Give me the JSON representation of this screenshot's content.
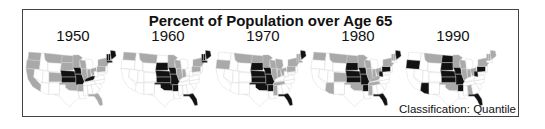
{
  "chart_data": {
    "type": "heatmap",
    "title": "Percent of Population over Age 65",
    "note": "Classification:  Quantile",
    "legend_classes": {
      "low": "#ffffff",
      "mid": "#a9a9a9",
      "high": "#111111"
    },
    "years": [
      "1950",
      "1960",
      "1970",
      "1980",
      "1990"
    ],
    "maps": [
      {
        "year": "1950",
        "high": [
          "NE",
          "KS",
          "IA",
          "MO",
          "KY",
          "ME",
          "NH",
          "VT",
          "MA"
        ],
        "mid": [
          "WA",
          "OR",
          "CA",
          "MT",
          "ND",
          "SD",
          "MN",
          "WI",
          "CO",
          "OK",
          "AR",
          "IL",
          "IN",
          "OH",
          "PA",
          "NY",
          "FL"
        ]
      },
      {
        "year": "1960",
        "high": [
          "SD",
          "NE",
          "KS",
          "IA",
          "MO",
          "OK",
          "AR",
          "FL",
          "ME",
          "NH",
          "VT",
          "MA"
        ],
        "mid": [
          "WA",
          "MT",
          "MN",
          "WI",
          "IL",
          "IN",
          "NY",
          "PA"
        ]
      },
      {
        "year": "1970",
        "high": [
          "SD",
          "NE",
          "KS",
          "IA",
          "MO",
          "OK",
          "AR",
          "FL",
          "ME"
        ],
        "mid": [
          "MT",
          "ND",
          "MN",
          "WI",
          "MI",
          "IL",
          "IN",
          "OH",
          "PA",
          "NY",
          "NH",
          "VT",
          "MA",
          "TN",
          "MS",
          "OR"
        ]
      },
      {
        "year": "1980",
        "high": [
          "SD",
          "NE",
          "KS",
          "IA",
          "MO",
          "AR",
          "FL",
          "WV",
          "PA",
          "ME"
        ],
        "mid": [
          "WA",
          "MT",
          "ND",
          "MN",
          "WI",
          "AZ",
          "CO",
          "OK",
          "IL",
          "IN",
          "OH",
          "KY",
          "TN",
          "MS",
          "NY",
          "NH",
          "VT"
        ]
      },
      {
        "year": "1990",
        "high": [
          "OR",
          "AZ",
          "ND",
          "SD",
          "NE",
          "KS",
          "IA",
          "MO",
          "AR",
          "FL",
          "WV",
          "PA"
        ],
        "mid": [
          "MT",
          "MN",
          "WI",
          "OK",
          "AL",
          "IL",
          "IN",
          "OH",
          "NY",
          "ME",
          "NH",
          "VT"
        ]
      }
    ]
  },
  "title": "Percent of Population over Age 65",
  "note": "Classification:  Quantile",
  "years": [
    "1950",
    "1960",
    "1970",
    "1980",
    "1990"
  ]
}
